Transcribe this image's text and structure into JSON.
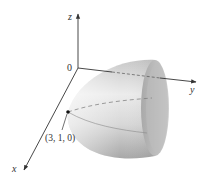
{
  "figure": {
    "type": "3D surface plot",
    "surface": "elliptic paraboloid opening along positive y-axis",
    "axes": {
      "x_label": "x",
      "y_label": "y",
      "z_label": "z",
      "origin_label": "0"
    },
    "point": {
      "label": "(3, 1, 0)",
      "coords": [
        3,
        1,
        0
      ]
    },
    "colors": {
      "surface_light": "#f2f2f2",
      "surface_mid": "#d6d6d6",
      "surface_dark": "#9a9a9a",
      "rim_inner": "#b8b8b8",
      "axis": "#333333",
      "dashed_line": "#777777",
      "point": "#111111"
    }
  }
}
